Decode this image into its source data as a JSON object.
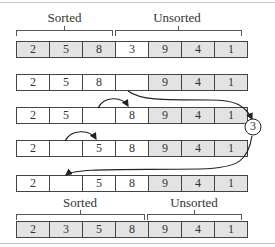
{
  "labels": {
    "top_sorted": "Sorted",
    "top_unsorted": "Unsorted",
    "bottom_sorted": "Sorted",
    "bottom_unsorted": "Unsorted",
    "temp_value": "3"
  },
  "rows": [
    {
      "cells": [
        "2",
        "5",
        "8",
        "3",
        "9",
        "4",
        "1"
      ],
      "shaded": [
        true,
        true,
        true,
        false,
        true,
        true,
        true
      ]
    },
    {
      "cells": [
        "2",
        "5",
        "8",
        "",
        "9",
        "4",
        "1"
      ],
      "shaded": [
        false,
        false,
        false,
        false,
        true,
        true,
        true
      ]
    },
    {
      "cells": [
        "2",
        "5",
        "",
        "8",
        "9",
        "4",
        "1"
      ],
      "shaded": [
        false,
        false,
        false,
        false,
        true,
        true,
        true
      ]
    },
    {
      "cells": [
        "2",
        "",
        "5",
        "8",
        "9",
        "4",
        "1"
      ],
      "shaded": [
        false,
        false,
        false,
        false,
        true,
        true,
        true
      ]
    },
    {
      "cells": [
        "2",
        "",
        "5",
        "8",
        "9",
        "4",
        "1"
      ],
      "shaded": [
        false,
        false,
        false,
        false,
        true,
        true,
        true
      ]
    },
    {
      "cells": [
        "2",
        "3",
        "5",
        "8",
        "9",
        "4",
        "1"
      ],
      "shaded": [
        true,
        true,
        true,
        true,
        true,
        true,
        true
      ]
    }
  ],
  "colors": {
    "shade": "#e3e3e3",
    "border": "#444444"
  }
}
